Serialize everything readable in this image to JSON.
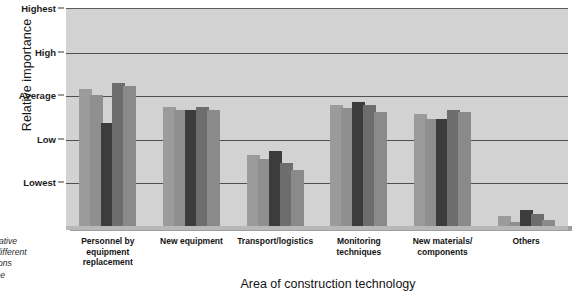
{
  "chart_data": {
    "type": "bar",
    "title": "",
    "xlabel": "Area of construction technology",
    "ylabel": "Relative importance",
    "categories": [
      "Personnel by equipment replacement",
      "New  equipment",
      "Transport/logistics",
      "Monitoring techniques",
      "New materials/ components",
      "Others"
    ],
    "ytick_labels": [
      "Highest",
      "High",
      "Average",
      "Low",
      "Lowest"
    ],
    "ytick_values": [
      5,
      4,
      3,
      2,
      1
    ],
    "ylim": [
      0,
      5.5
    ],
    "grid": true,
    "legend": "none",
    "series": [
      {
        "name": "Series 1",
        "color": "#9b9b9b",
        "values": [
          3.45,
          3.0,
          1.78,
          3.05,
          2.82,
          0.25
        ]
      },
      {
        "name": "Series 2",
        "color": "#8f8f8f",
        "values": [
          3.3,
          2.92,
          1.68,
          2.98,
          2.7,
          0.1
        ]
      },
      {
        "name": "Series 3",
        "color": "#3c3c3c",
        "values": [
          2.6,
          2.92,
          1.9,
          3.12,
          2.7,
          0.4
        ]
      },
      {
        "name": "Series 4",
        "color": "#6d6d6d",
        "values": [
          3.62,
          3.0,
          1.58,
          3.05,
          2.92,
          0.3
        ]
      },
      {
        "name": "Series 5",
        "color": "#8a8a8a",
        "values": [
          3.52,
          2.92,
          1.42,
          2.88,
          2.88,
          0.14
        ]
      }
    ]
  },
  "caption": {
    "lines": [
      "Relative",
      "of different",
      "rations",
      "n the"
    ]
  },
  "colors": {
    "plot_background": "#d2d2d2",
    "gridline": "#4f4f4f",
    "text": "#141414"
  }
}
